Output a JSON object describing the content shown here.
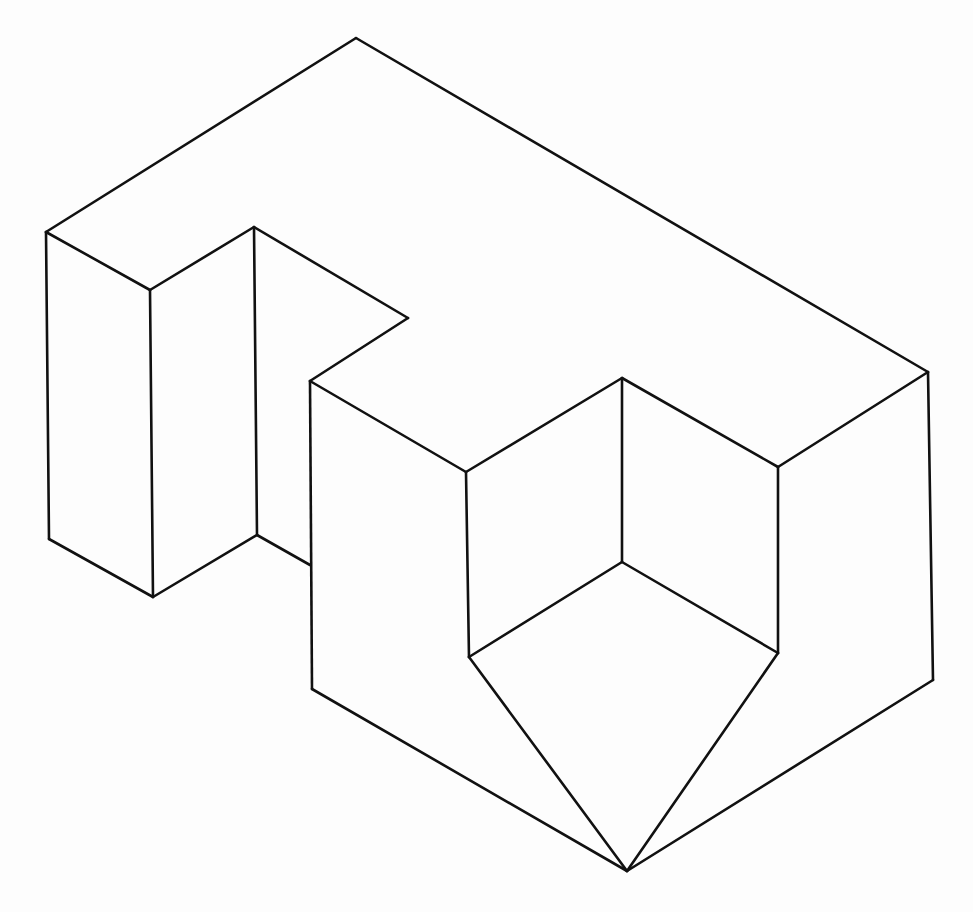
{
  "diagram": {
    "type": "isometric-line-drawing",
    "stroke_color": "#111111",
    "background": "#fdfdfd",
    "vertices": {
      "top": [
        356,
        38
      ],
      "back_right": [
        928,
        372
      ],
      "left_top": [
        46,
        232
      ],
      "left_col_front_top": [
        150,
        290
      ],
      "notch_top": [
        254,
        227
      ],
      "notch_right": [
        408,
        318
      ],
      "front_left_top": [
        310,
        381
      ],
      "cut_left_top": [
        466,
        472
      ],
      "cut_back_top": [
        622,
        378
      ],
      "cut_right_top": [
        778,
        467
      ],
      "cut_inner_bottom": [
        622,
        562
      ],
      "cut_left_bottom": [
        469,
        657
      ],
      "cut_right_bottom": [
        778,
        653
      ],
      "left_bottom": [
        49,
        539
      ],
      "left_col_bottom": [
        153,
        597
      ],
      "notch_bottom": [
        257,
        535
      ],
      "front_left_join": [
        310,
        565
      ],
      "front_left_bottom": [
        312,
        689
      ],
      "bottom_tip": [
        627,
        871
      ],
      "right_bottom": [
        933,
        680
      ]
    },
    "edges": [
      [
        "top",
        "back_right"
      ],
      [
        "top",
        "left_top"
      ],
      [
        "left_top",
        "left_col_front_top"
      ],
      [
        "left_col_front_top",
        "notch_top"
      ],
      [
        "notch_top",
        "notch_right"
      ],
      [
        "notch_right",
        "front_left_top"
      ],
      [
        "front_left_top",
        "cut_left_top"
      ],
      [
        "cut_left_top",
        "cut_back_top"
      ],
      [
        "cut_back_top",
        "cut_right_top"
      ],
      [
        "cut_right_top",
        "back_right"
      ],
      [
        "left_top",
        "left_bottom"
      ],
      [
        "left_col_front_top",
        "left_col_bottom"
      ],
      [
        "notch_top",
        "notch_bottom"
      ],
      [
        "front_left_top",
        "front_left_bottom"
      ],
      [
        "cut_left_top",
        "cut_left_bottom"
      ],
      [
        "cut_back_top",
        "cut_inner_bottom"
      ],
      [
        "cut_right_top",
        "cut_right_bottom"
      ],
      [
        "back_right",
        "right_bottom"
      ],
      [
        "left_bottom",
        "left_col_bottom"
      ],
      [
        "left_col_bottom",
        "notch_bottom"
      ],
      [
        "notch_bottom",
        "front_left_join"
      ],
      [
        "cut_inner_bottom",
        "cut_left_bottom"
      ],
      [
        "cut_inner_bottom",
        "cut_right_bottom"
      ],
      [
        "cut_left_bottom",
        "bottom_tip"
      ],
      [
        "cut_right_bottom",
        "bottom_tip"
      ],
      [
        "front_left_bottom",
        "bottom_tip"
      ],
      [
        "bottom_tip",
        "right_bottom"
      ]
    ]
  }
}
